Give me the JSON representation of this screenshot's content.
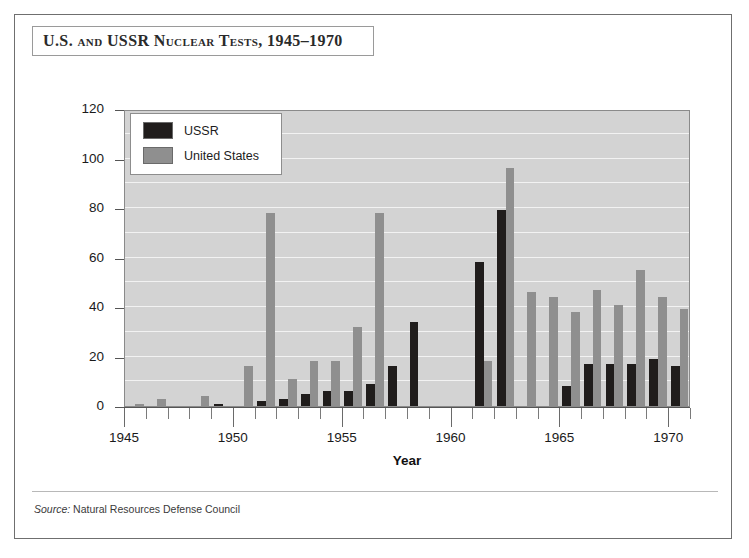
{
  "figure": {
    "title": "U.S. and USSR Nuclear Tests, 1945–1970",
    "source_label": "Source:",
    "source_text": " Natural Resources Defense Council"
  },
  "legend": {
    "position": "top-left-inside",
    "items": [
      {
        "label": "USSR",
        "color": "#201d1c"
      },
      {
        "label": "United States",
        "color": "#8f8f8f"
      }
    ]
  },
  "colors": {
    "ussr": "#201d1c",
    "united_states": "#8f8f8f",
    "plot_background": "#d3d3d3",
    "gridline": "#f2f2f2",
    "frame": "#6f6f6f",
    "text": "#1a1a1a"
  },
  "chart_data": {
    "type": "bar",
    "title": "U.S. and USSR Nuclear Tests, 1945–1970",
    "xlabel": "Year",
    "ylabel": "Number of Tests",
    "ylim": [
      0,
      120
    ],
    "ytick_step": 20,
    "yticks": [
      0,
      20,
      40,
      60,
      80,
      100,
      120
    ],
    "gridline_step": 10,
    "grid": true,
    "xlim": [
      1945,
      1970
    ],
    "xtick_step": 1,
    "xtick_labels": [
      "1945",
      "1950",
      "1955",
      "1960",
      "1965",
      "1970"
    ],
    "xtick_label_years": [
      1945,
      1950,
      1955,
      1960,
      1965,
      1970
    ],
    "categories": [
      1945,
      1946,
      1947,
      1948,
      1949,
      1950,
      1951,
      1952,
      1953,
      1954,
      1955,
      1956,
      1957,
      1958,
      1959,
      1960,
      1961,
      1962,
      1963,
      1964,
      1965,
      1966,
      1967,
      1968,
      1969,
      1970
    ],
    "series": [
      {
        "name": "USSR",
        "color": "#201d1c",
        "values": [
          0,
          0,
          0,
          0,
          1,
          0,
          2,
          3,
          5,
          6,
          6,
          9,
          16,
          34,
          0,
          0,
          58,
          79,
          0,
          0,
          8,
          17,
          17,
          17,
          19,
          16
        ]
      },
      {
        "name": "United States",
        "color": "#8f8f8f",
        "values": [
          1,
          3,
          0,
          4,
          0,
          16,
          78,
          11,
          18,
          18,
          32,
          78,
          0,
          0,
          0,
          0,
          18,
          96,
          46,
          44,
          38,
          47,
          41,
          55,
          44,
          39
        ]
      }
    ]
  }
}
